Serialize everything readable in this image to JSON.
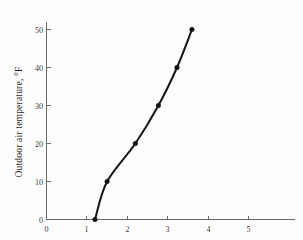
{
  "chart_data": {
    "type": "line",
    "title": "",
    "subtitle": "",
    "xlabel": "",
    "ylabel": "Outdoor air temperature, °F",
    "xlim": [
      0,
      5.9
    ],
    "ylim": [
      0,
      55
    ],
    "grid": false,
    "legend": null,
    "legend_position": "none",
    "marker": "filled-circle",
    "x_ticks": [
      0,
      1,
      2,
      3,
      4,
      5
    ],
    "x_tick_labels": [
      "0",
      "1",
      "2",
      "3",
      "4",
      "5"
    ],
    "y_ticks": [
      0,
      10,
      20,
      30,
      40,
      50
    ],
    "y_tick_labels": [
      "0",
      "10",
      "20",
      "30",
      "40",
      "50"
    ],
    "series": [
      {
        "name": "curve",
        "x": [
          1.2,
          1.5,
          2.2,
          2.77,
          3.23,
          3.6
        ],
        "y": [
          0,
          10,
          20,
          30,
          40,
          50
        ]
      }
    ],
    "annotations": []
  },
  "axes": {
    "y_title": "Outdoor air temperature, °F",
    "x_title": "",
    "y_tick_0": "0",
    "y_tick_10": "10",
    "y_tick_20": "20",
    "y_tick_30": "30",
    "y_tick_40": "40",
    "y_tick_50": "50",
    "x_tick_0": "0",
    "x_tick_1": "1",
    "x_tick_2": "2",
    "x_tick_3": "3",
    "x_tick_4": "4",
    "x_tick_5": "5"
  },
  "colors": {
    "curve": "#141414",
    "marker": "#111111",
    "axis": "#6b6b6b",
    "background": "#fdfdfd",
    "text": "#1f1f1f"
  }
}
